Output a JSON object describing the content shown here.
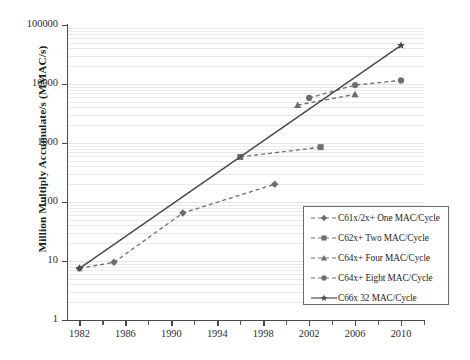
{
  "chart_data": {
    "type": "line",
    "title": "",
    "xlabel": "",
    "ylabel": "Million Multiply Accumulate/s (MMAC/s)",
    "y_scale": "log",
    "ylim": [
      1,
      100000
    ],
    "xlim": [
      1981,
      2012
    ],
    "grid": true,
    "legend_position": "inside-lower-right",
    "y_ticks": [
      "1",
      "10",
      "100",
      "1000",
      "10000",
      "100000"
    ],
    "y_tick_values": [
      1,
      10,
      100,
      1000,
      10000,
      100000
    ],
    "x_ticks": [
      "1982",
      "1986",
      "1990",
      "1994",
      "1998",
      "2002",
      "2006",
      "2010"
    ],
    "x_tick_values": [
      1982,
      1986,
      1990,
      1994,
      1998,
      2002,
      2006,
      2010
    ],
    "x_minor_ticks": [
      1984,
      1988,
      1992,
      1996,
      2000,
      2004,
      2008,
      2012
    ],
    "series": [
      {
        "name": "C61x/2x+ One MAC/Cycle",
        "marker": "diamond",
        "style": "dashed",
        "color": "#6e6e6e",
        "x": [
          1982,
          1985,
          1991,
          1999
        ],
        "y": [
          7.5,
          9.5,
          65,
          200
        ]
      },
      {
        "name": "C62x+ Two MAC/Cycle",
        "marker": "square",
        "style": "dashed",
        "color": "#6e6e6e",
        "x": [
          1996,
          2003
        ],
        "y": [
          580,
          850
        ]
      },
      {
        "name": "C64x+ Four MAC/Cycle",
        "marker": "triangle",
        "style": "dashed",
        "color": "#6e6e6e",
        "x": [
          2001,
          2006
        ],
        "y": [
          4400,
          6700
        ]
      },
      {
        "name": "C64x+ Eight MAC/Cycle",
        "marker": "circle",
        "style": "dashed",
        "color": "#6e6e6e",
        "x": [
          2002,
          2006,
          2010
        ],
        "y": [
          5800,
          9600,
          11500
        ]
      },
      {
        "name": "C66x 32 MAC/Cycle",
        "marker": "star",
        "style": "solid",
        "color": "#4a4a4a",
        "x": [
          1982,
          2010
        ],
        "y": [
          7.5,
          45000
        ]
      }
    ]
  },
  "legend": {
    "items": [
      {
        "label": "C61x/2x+ One MAC/Cycle"
      },
      {
        "label": "C62x+ Two MAC/Cycle"
      },
      {
        "label": "C64x+ Four MAC/Cycle"
      },
      {
        "label": "C64x+ Eight MAC/Cycle"
      },
      {
        "label": "C66x 32 MAC/Cycle"
      }
    ]
  }
}
